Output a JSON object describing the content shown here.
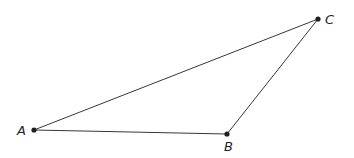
{
  "diagram": {
    "type": "triangle",
    "points": [
      {
        "label": "A",
        "x": 34,
        "y": 130,
        "lx": 17,
        "ly": 135
      },
      {
        "label": "B",
        "x": 227,
        "y": 134,
        "lx": 224,
        "ly": 151
      },
      {
        "label": "C",
        "x": 318,
        "y": 19,
        "lx": 325,
        "ly": 24
      }
    ],
    "segments": [
      [
        "A",
        "B"
      ],
      [
        "B",
        "C"
      ],
      [
        "C",
        "A"
      ]
    ],
    "stroke_color": "#231f20"
  }
}
